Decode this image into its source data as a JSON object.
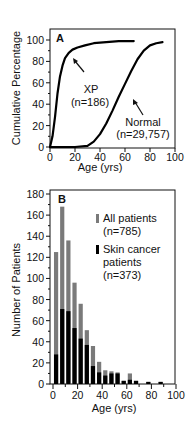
{
  "header_fragment": "",
  "chart_data": [
    {
      "type": "line",
      "panel": "A",
      "title": "",
      "xlabel": "Age (yrs)",
      "ylabel": "Cumulative Percentage",
      "xlim": [
        0,
        100
      ],
      "ylim": [
        0,
        100
      ],
      "xticks": [
        0,
        20,
        40,
        60,
        80,
        100
      ],
      "yticks": [
        0,
        20,
        40,
        60,
        80,
        100
      ],
      "grid": false,
      "series": [
        {
          "name": "XP",
          "label_line1": "XP",
          "label_line2": "(n=186)",
          "x": [
            0,
            2,
            4,
            6,
            8,
            10,
            12,
            15,
            18,
            22,
            28,
            35,
            45,
            55,
            67
          ],
          "y": [
            0,
            10,
            28,
            50,
            66,
            76,
            83,
            88,
            91,
            93,
            95,
            97,
            98,
            99,
            99
          ]
        },
        {
          "name": "Normal",
          "label_line1": "Normal",
          "label_line2": "(n=29,757)",
          "x": [
            0,
            10,
            20,
            30,
            35,
            40,
            45,
            50,
            55,
            60,
            65,
            70,
            75,
            80,
            85,
            90
          ],
          "y": [
            0,
            0,
            0,
            1,
            5,
            12,
            22,
            34,
            47,
            59,
            71,
            82,
            90,
            95,
            97,
            98
          ]
        }
      ]
    },
    {
      "type": "bar",
      "panel": "B",
      "title": "",
      "xlabel": "Age (yrs)",
      "ylabel": "Number of Patients",
      "xlim": [
        0,
        100
      ],
      "ylim": [
        0,
        180
      ],
      "xticks": [
        0,
        20,
        40,
        60,
        80,
        100
      ],
      "yticks": [
        0,
        20,
        40,
        60,
        80,
        100,
        120,
        140,
        160,
        180
      ],
      "grid": false,
      "categories": [
        2.5,
        7.5,
        12.5,
        17.5,
        22.5,
        27.5,
        32.5,
        37.5,
        42.5,
        47.5,
        52.5,
        57.5,
        62.5,
        67.5,
        72.5,
        77.5,
        82.5,
        87.5
      ],
      "series": [
        {
          "name": "All patients",
          "label_line1": "All patients",
          "label_line2": "(n=785)",
          "color": "#7a7a7a",
          "values": [
            125,
            168,
            136,
            96,
            76,
            51,
            36,
            21,
            13,
            12,
            11,
            3,
            10,
            3,
            0,
            2,
            0,
            2
          ]
        },
        {
          "name": "Skin cancer patients",
          "label_line1": "Skin cancer",
          "label_line2": "patients",
          "label_line3": "(n=373)",
          "color": "#000000",
          "values": [
            28,
            71,
            69,
            53,
            43,
            37,
            17,
            11,
            8,
            10,
            10,
            3,
            4,
            3,
            0,
            2,
            0,
            2
          ]
        }
      ]
    }
  ]
}
